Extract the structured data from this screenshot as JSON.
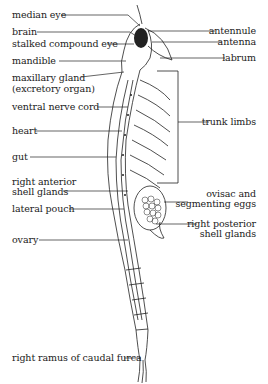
{
  "diagram": {
    "ink_color": "#222222",
    "background": "#ffffff",
    "labels_left": [
      {
        "id": "median-eye",
        "text": "median eye"
      },
      {
        "id": "brain",
        "text": "brain"
      },
      {
        "id": "stalked-compound-eye",
        "text": "stalked compound eye"
      },
      {
        "id": "mandible",
        "text": "mandible"
      },
      {
        "id": "maxillary-gland",
        "line1": "maxillary gland",
        "line2": "(excretory organ)"
      },
      {
        "id": "ventral-nerve-cord",
        "text": "ventral nerve cord"
      },
      {
        "id": "heart",
        "text": "heart"
      },
      {
        "id": "gut",
        "text": "gut"
      },
      {
        "id": "right-anterior-shell-glands",
        "line1": "right anterior",
        "line2": "shell glands"
      },
      {
        "id": "lateral-pouch",
        "text": "lateral pouch"
      },
      {
        "id": "ovary",
        "text": "ovary"
      },
      {
        "id": "right-ramus-of-caudal-furca",
        "text": "right ramus of caudal furca"
      }
    ],
    "labels_right": [
      {
        "id": "antennule",
        "text": "antennule"
      },
      {
        "id": "antenna",
        "text": "antenna"
      },
      {
        "id": "labrum",
        "text": "labrum"
      },
      {
        "id": "trunk-limbs",
        "text": "trunk limbs"
      },
      {
        "id": "ovisac-and-segmenting-eggs",
        "line1": "ovisac and",
        "line2": "segmenting eggs"
      },
      {
        "id": "right-posterior-shell-glands",
        "line1": "right posterior",
        "line2": "shell glands"
      }
    ]
  }
}
